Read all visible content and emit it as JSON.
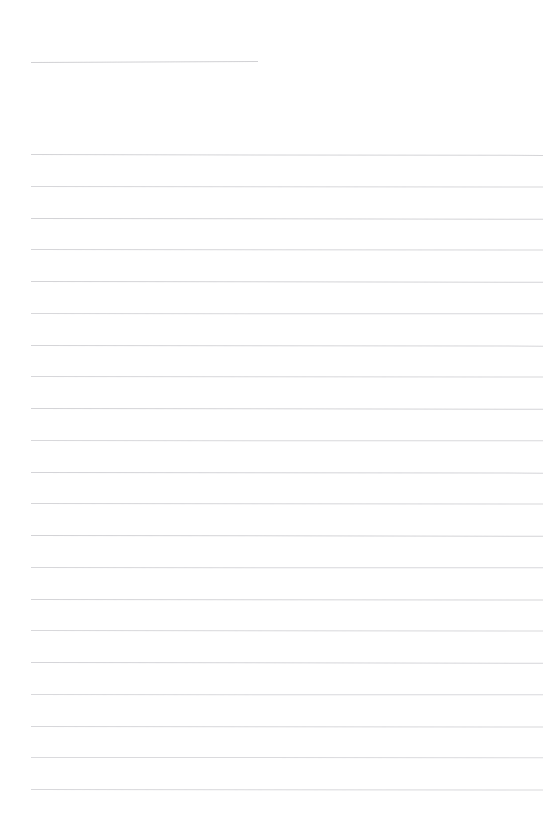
{
  "page": {
    "name": "blank-lined-paper",
    "width": 545,
    "height": 836,
    "background_color": "#ffffff",
    "paper_type": "ruled-notebook-page",
    "visible_text": "",
    "text_content_present": false,
    "notes_label": ""
  },
  "rules": {
    "color": "#c9c9cd",
    "thickness_px": 1,
    "left_margin_px": 31,
    "right_edge_px": 543,
    "line_spacing_px": 31.75,
    "header_rule": {
      "name": "header-rule",
      "x": 31,
      "y": 62,
      "width": 227,
      "opacity": 0.85,
      "tilt_deg": -0.25
    },
    "body_count": 21,
    "body_lines": [
      {
        "y": 154.0,
        "opacity": 0.8,
        "tilt_deg": 0.1
      },
      {
        "y": 185.8,
        "opacity": 0.74,
        "tilt_deg": 0.06
      },
      {
        "y": 217.5,
        "opacity": 0.82,
        "tilt_deg": 0.08
      },
      {
        "y": 249.3,
        "opacity": 0.76,
        "tilt_deg": 0.05
      },
      {
        "y": 281.0,
        "opacity": 0.8,
        "tilt_deg": 0.09
      },
      {
        "y": 312.8,
        "opacity": 0.72,
        "tilt_deg": 0.04
      },
      {
        "y": 344.5,
        "opacity": 0.78,
        "tilt_deg": 0.07
      },
      {
        "y": 376.3,
        "opacity": 0.75,
        "tilt_deg": 0.05
      },
      {
        "y": 408.0,
        "opacity": 0.8,
        "tilt_deg": 0.08
      },
      {
        "y": 439.8,
        "opacity": 0.73,
        "tilt_deg": 0.04
      },
      {
        "y": 471.5,
        "opacity": 0.79,
        "tilt_deg": 0.07
      },
      {
        "y": 503.3,
        "opacity": 0.76,
        "tilt_deg": 0.05
      },
      {
        "y": 535.0,
        "opacity": 0.81,
        "tilt_deg": 0.09
      },
      {
        "y": 566.8,
        "opacity": 0.74,
        "tilt_deg": 0.04
      },
      {
        "y": 598.5,
        "opacity": 0.78,
        "tilt_deg": 0.06
      },
      {
        "y": 630.3,
        "opacity": 0.72,
        "tilt_deg": 0.05
      },
      {
        "y": 662.0,
        "opacity": 0.77,
        "tilt_deg": 0.08
      },
      {
        "y": 693.8,
        "opacity": 0.7,
        "tilt_deg": 0.04
      },
      {
        "y": 725.5,
        "opacity": 0.75,
        "tilt_deg": 0.06
      },
      {
        "y": 757.3,
        "opacity": 0.68,
        "tilt_deg": 0.03
      },
      {
        "y": 789.0,
        "opacity": 0.72,
        "tilt_deg": 0.05
      }
    ]
  }
}
